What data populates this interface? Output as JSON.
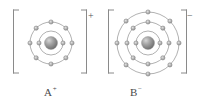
{
  "figure": {
    "background_color": "#ffffff",
    "width": 203,
    "height": 104
  },
  "colors": {
    "shell_stroke": "#8f8f8f",
    "electron_fill": "#b9b9b9",
    "electron_stroke": "#7d7d7d",
    "nucleus_dark": "#7c7c7c",
    "nucleus_light": "#cfcfcf",
    "bracket": "#8a8a8a",
    "text": "#4a4a4a"
  },
  "species": [
    {
      "id": "cation",
      "label": "A",
      "charge": "+",
      "charge_symbol": "+",
      "bracket": true,
      "nucleus": {
        "cx": 51,
        "cy": 43,
        "r": 6.5
      },
      "shells": [
        {
          "index": 1,
          "radius": 12,
          "electrons": 2
        },
        {
          "index": 2,
          "radius": 21,
          "electrons": 8
        }
      ],
      "electron_total": 10
    },
    {
      "id": "anion",
      "label": "B",
      "charge": "-",
      "charge_symbol": "−",
      "bracket": true,
      "nucleus": {
        "cx": 148,
        "cy": 43,
        "r": 6.5
      },
      "shells": [
        {
          "index": 1,
          "radius": 12,
          "electrons": 2
        },
        {
          "index": 2,
          "radius": 21,
          "electrons": 8
        },
        {
          "index": 3,
          "radius": 31,
          "electrons": 8
        }
      ],
      "electron_total": 18
    }
  ],
  "labels": {
    "left_atom": "A",
    "left_atom_charge": "+",
    "right_atom": "B",
    "right_atom_charge": "−",
    "bracket_charge_left": "+",
    "bracket_charge_right": "−"
  }
}
